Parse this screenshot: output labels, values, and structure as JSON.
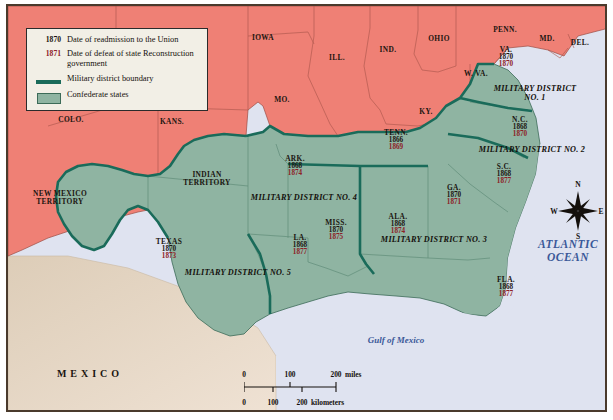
{
  "legend": {
    "rows": [
      {
        "key": "1870",
        "key_type": "readmission-date",
        "text": "Date of readmission to the Union"
      },
      {
        "key": "1871",
        "key_type": "defeat-date",
        "text": "Date of defeat of state Reconstruction government"
      },
      {
        "key": "",
        "key_type": "boundary-line",
        "text": "Military district boundary"
      },
      {
        "key": "",
        "key_type": "confederate-swatch",
        "text": "Confederate states"
      }
    ]
  },
  "colors": {
    "union_states": "#ef8075",
    "confederate_states": "#8fb4a2",
    "district_boundary": "#1a6b5a",
    "water": "#dfe3f0",
    "mexico": "#e8d9c8",
    "readmission_text": "#1b1510",
    "defeat_text": "#8d2026",
    "water_label": "#3a5898",
    "frame": "#4a3a2c"
  },
  "confederate_states": [
    {
      "name": "VA.",
      "readmitted": "1870",
      "defeated": "1870",
      "x": 504,
      "y": 55
    },
    {
      "name": "N.C.",
      "readmitted": "1868",
      "defeated": "1870",
      "x": 518,
      "y": 125
    },
    {
      "name": "S.C.",
      "readmitted": "1868",
      "defeated": "1877",
      "x": 502,
      "y": 172
    },
    {
      "name": "GA.",
      "readmitted": "1870",
      "defeated": "1871",
      "x": 452,
      "y": 193
    },
    {
      "name": "FLA.",
      "readmitted": "1868",
      "defeated": "1877",
      "x": 504,
      "y": 285
    },
    {
      "name": "ALA.",
      "readmitted": "1868",
      "defeated": "1874",
      "x": 396,
      "y": 222
    },
    {
      "name": "MISS.",
      "readmitted": "1870",
      "defeated": "1875",
      "x": 334,
      "y": 228
    },
    {
      "name": "TENN.",
      "readmitted": "1866",
      "defeated": "1869",
      "x": 394,
      "y": 138
    },
    {
      "name": "ARK.",
      "readmitted": "1868",
      "defeated": "1874",
      "x": 293,
      "y": 164
    },
    {
      "name": "LA.",
      "readmitted": "1868",
      "defeated": "1877",
      "x": 298,
      "y": 243
    },
    {
      "name": "TEXAS",
      "readmitted": "1870",
      "defeated": "1873",
      "x": 167,
      "y": 247
    }
  ],
  "union_states": [
    {
      "name": "IOWA",
      "x": 261,
      "y": 36
    },
    {
      "name": "ILL.",
      "x": 335,
      "y": 56
    },
    {
      "name": "IND.",
      "x": 386,
      "y": 48
    },
    {
      "name": "OHIO",
      "x": 437,
      "y": 37
    },
    {
      "name": "PENN.",
      "x": 503,
      "y": 28
    },
    {
      "name": "MD.",
      "x": 545,
      "y": 37
    },
    {
      "name": "DEL.",
      "x": 578,
      "y": 41
    },
    {
      "name": "W. VA.",
      "x": 474,
      "y": 72
    },
    {
      "name": "KY.",
      "x": 424,
      "y": 110
    },
    {
      "name": "MO.",
      "x": 280,
      "y": 98
    },
    {
      "name": "KANS.",
      "x": 170,
      "y": 120
    },
    {
      "name": "COLO.",
      "x": 69,
      "y": 118
    }
  ],
  "territories": [
    {
      "name": "NEW MEXICO TERRITORY",
      "line1": "NEW MEXICO",
      "line2": "TERRITORY",
      "x": 58,
      "y": 196
    },
    {
      "name": "INDIAN TERRITORY",
      "line1": "INDIAN",
      "line2": "TERRITORY",
      "x": 205,
      "y": 177
    }
  ],
  "military_districts": [
    {
      "label": "MILITARY DISTRICT",
      "label2": "NO. 1",
      "x": 533,
      "y": 91,
      "two_line": true
    },
    {
      "label": "MILITARY DISTRICT NO. 2",
      "x": 530,
      "y": 148,
      "two_line": false
    },
    {
      "label": "MILITARY DISTRICT NO. 3",
      "x": 432,
      "y": 238,
      "two_line": false
    },
    {
      "label": "MILITARY DISTRICT NO. 4",
      "x": 302,
      "y": 196,
      "two_line": false
    },
    {
      "label": "MILITARY DISTRICT NO. 5",
      "x": 236,
      "y": 271,
      "two_line": false
    }
  ],
  "water_labels": [
    {
      "name": "Gulf of Mexico",
      "x": 394,
      "y": 338,
      "style": "gulf"
    },
    {
      "name": "ATLANTIC",
      "line2": "OCEAN",
      "x": 566,
      "y": 249,
      "style": "atlantic"
    }
  ],
  "country_labels": [
    {
      "name": "MEXICO",
      "x": 88,
      "y": 371
    }
  ],
  "compass": {
    "north": "N",
    "south": "S",
    "east": "E",
    "west": "W"
  },
  "scale_bar": {
    "miles": {
      "ticks": [
        "0",
        "100",
        "200"
      ],
      "unit": "miles"
    },
    "kilometers": {
      "ticks": [
        "0",
        "100",
        "200"
      ],
      "unit": "kilometers"
    }
  }
}
